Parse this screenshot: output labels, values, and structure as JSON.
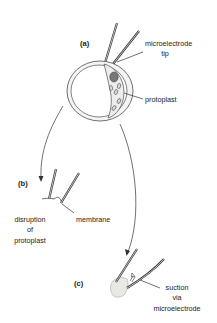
{
  "diagram": {
    "panels": {
      "a": "(a)",
      "b": "(b)",
      "c": "(c)"
    },
    "labels": {
      "microelectrode_tip_line1": "microelectrode",
      "microelectrode_tip_line2": "tip",
      "protoplast": "protoplast",
      "membrane": "membrane",
      "disruption_line1": "disruption",
      "disruption_line2": "of",
      "disruption_line3": "protoplast",
      "suction_line1": "suction",
      "suction_line2": "via",
      "suction_line3": "microelectrode"
    },
    "colors": {
      "stroke": "#333333",
      "cell_fill": "#f4f4f4",
      "protoplast_fill": "#ececec",
      "nucleus_fill": "#777777",
      "chloroplast_fill": "#d8d8d8",
      "blob_fill": "#e8e8e4"
    }
  }
}
